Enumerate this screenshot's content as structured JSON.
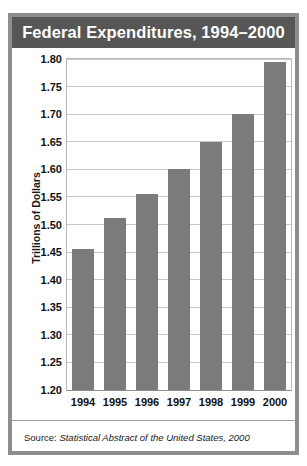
{
  "figure": {
    "title": "Federal Expenditures, 1994–2000",
    "source_label": "Source:",
    "source_work": "Statistical Abstract of the United States, 2000",
    "frame_color": "#8e8e8e",
    "title_bar_color": "#565656",
    "bar_color": "#7b7b7b",
    "grid_color": "#c9c9c9"
  },
  "chart_data": {
    "type": "bar",
    "title": "Federal Expenditures, 1994–2000",
    "xlabel": "",
    "ylabel": "Trillions of Dollars",
    "categories": [
      "1994",
      "1995",
      "1996",
      "1997",
      "1998",
      "1999",
      "2000"
    ],
    "values": [
      1.455,
      1.512,
      1.555,
      1.6,
      1.65,
      1.7,
      1.795
    ],
    "ylim": [
      1.2,
      1.8
    ],
    "yticks": [
      1.8,
      1.75,
      1.7,
      1.65,
      1.6,
      1.55,
      1.5,
      1.45,
      1.4,
      1.35,
      1.3,
      1.25,
      1.2
    ],
    "ytick_labels": [
      "1.80",
      "1.75",
      "1.70",
      "1.65",
      "1.60",
      "1.55",
      "1.50",
      "1.45",
      "1.40",
      "1.35",
      "1.30",
      "1.25",
      "1.20"
    ],
    "grid": true,
    "legend": false,
    "legend_position": "none"
  }
}
